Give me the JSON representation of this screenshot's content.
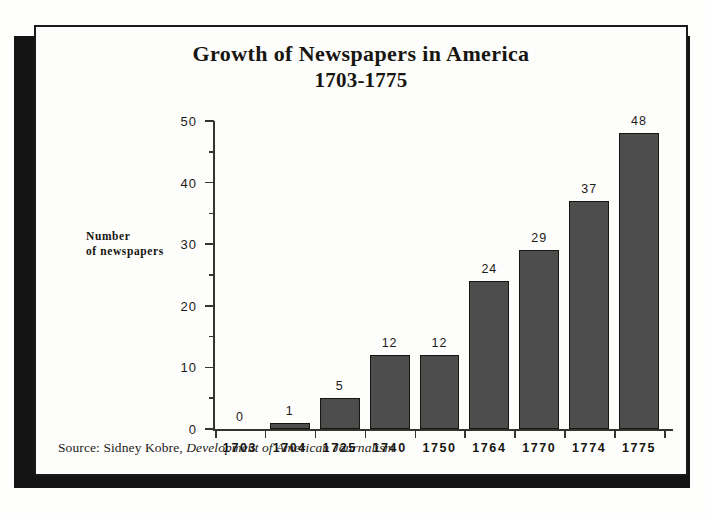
{
  "figure": {
    "title_line_1": "Growth of Newspapers in America",
    "title_line_2": "1703-1775",
    "y_axis_label_line_1": "Number",
    "y_axis_label_line_2": "of newspapers",
    "source_prefix": "Source: Sidney Kobre, ",
    "source_book": "Development of American Journalism",
    "colors": {
      "bar_fill": "#4d4d4d",
      "bar_outline": "#16150f",
      "axis": "#35332e",
      "text": "#1d1b17",
      "frame_border": "#1a1a1a",
      "shadow_block": "#141414",
      "page_background": "#fefefd"
    }
  },
  "chart_data": {
    "type": "bar",
    "title": "Growth of Newspapers in America 1703-1775",
    "subtitle": "1703-1775",
    "xlabel": "",
    "ylabel": "Number of newspapers",
    "categories": [
      "1703",
      "1704",
      "1725",
      "1740",
      "1750",
      "1764",
      "1770",
      "1774",
      "1775"
    ],
    "values": [
      0,
      1,
      5,
      12,
      12,
      24,
      29,
      37,
      48
    ],
    "data_labels": [
      "0",
      "1",
      "5",
      "12",
      "12",
      "24",
      "29",
      "37",
      "48"
    ],
    "ylim": [
      0,
      50
    ],
    "y_major_ticks": [
      0,
      10,
      20,
      30,
      40,
      50
    ],
    "y_minor_ticks": [
      5,
      15,
      25,
      35,
      45
    ],
    "y_tick_labels": [
      "0",
      "10",
      "20",
      "30",
      "40",
      "50"
    ],
    "grid": false,
    "legend": false,
    "legend_position": "none",
    "annotations": [
      "Source: Sidney Kobre, Development of American Journalism"
    ]
  }
}
